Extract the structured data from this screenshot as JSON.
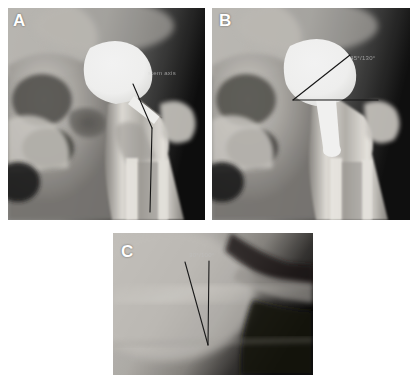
{
  "figure": {
    "width": 419,
    "height": 385,
    "background": "#ffffff",
    "modality": "radiograph"
  },
  "panels": [
    {
      "id": "panel-a",
      "letter": "A",
      "letter_color": "#ffffff",
      "view": "anteroposterior-hip",
      "x": 8,
      "y": 8,
      "width": 197,
      "height": 212,
      "letter_x": 13,
      "letter_y": 12,
      "annotation": {
        "text": "stem axis",
        "color": "#d8d8d8",
        "x": 148,
        "y": 70
      },
      "measurement": {
        "type": "stem-axis-line",
        "stroke": "#141414",
        "stroke_width": 1.1,
        "points": [
          [
            133,
            84
          ],
          [
            152,
            128
          ],
          [
            150,
            212
          ]
        ]
      }
    },
    {
      "id": "panel-b",
      "letter": "B",
      "letter_color": "#ffffff",
      "view": "anteroposterior-hip",
      "x": 212,
      "y": 8,
      "width": 198,
      "height": 212,
      "letter_x": 219,
      "letter_y": 12,
      "annotation": {
        "text": "45°/130°",
        "color": "#d8d8d8",
        "x": 350,
        "y": 55
      },
      "measurement": {
        "type": "angle-two-rays",
        "stroke": "#141414",
        "stroke_width": 1.1,
        "vertex": [
          293,
          100
        ],
        "ray_a": [
          350,
          55
        ],
        "ray_b": [
          378,
          100
        ]
      }
    },
    {
      "id": "panel-c",
      "letter": "C",
      "letter_color": "#ffffff",
      "view": "lateral-hip",
      "x": 113,
      "y": 233,
      "width": 200,
      "height": 142,
      "letter_x": 121,
      "letter_y": 243,
      "annotation": {
        "text": "30°/100°",
        "color": "#bfbfbf",
        "x": 189,
        "y": 252
      },
      "measurement": {
        "type": "angle-v-narrow",
        "stroke": "#1a1a1a",
        "stroke_width": 1.1,
        "vertex": [
          208,
          345
        ],
        "ray_a": [
          185,
          262
        ],
        "ray_b": [
          209,
          261
        ]
      }
    }
  ],
  "colors": {
    "page_background": "#ffffff",
    "bone_bright": "#f2f0ec",
    "prosthesis_white": "#ffffff",
    "soft_tissue_mid": "#8d8d8d",
    "soft_tissue_dark": "#3a3a3a",
    "film_black": "#0c0c0c",
    "measure_line": "#141414",
    "panel_letter": "#ffffff"
  }
}
